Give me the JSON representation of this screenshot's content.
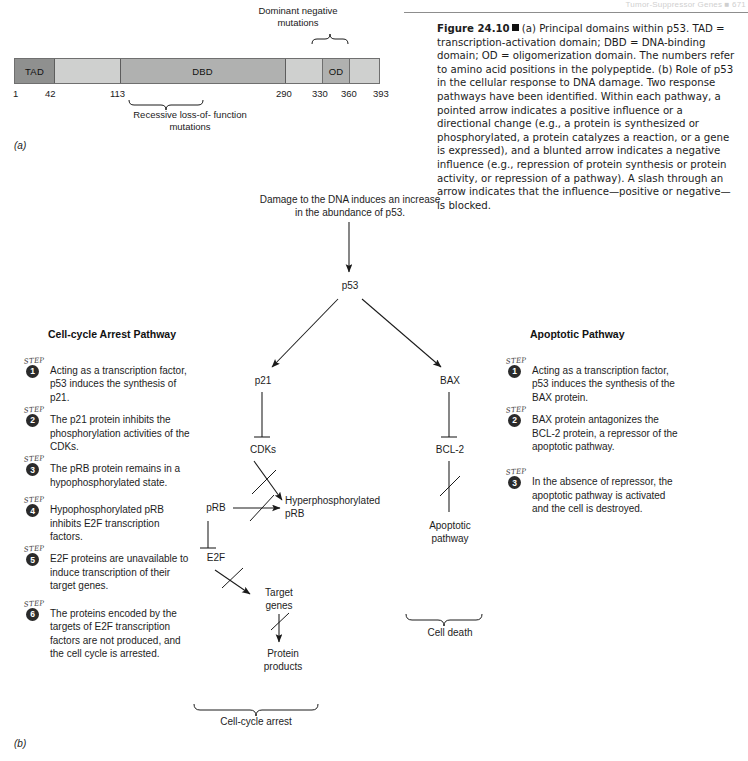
{
  "running_head": "Tumor-Suppressor Genes  ■  671",
  "panel_a": {
    "letter": "(a)",
    "bar_segments": [
      {
        "id": "TAD",
        "label": "TAD"
      },
      {
        "id": "spacer1",
        "label": ""
      },
      {
        "id": "DBD",
        "label": "DBD"
      },
      {
        "id": "spacer2",
        "label": ""
      },
      {
        "id": "OD",
        "label": "OD"
      },
      {
        "id": "spacer3",
        "label": ""
      }
    ],
    "axis_numbers": [
      "1",
      "42",
      "113",
      "290",
      "330",
      "360",
      "393"
    ],
    "dominant_label": "Dominant negative\nmutations",
    "recessive_label": "Recessive loss-of-\nfunction mutations"
  },
  "panel_b": {
    "letter": "(b)"
  },
  "caption": {
    "figure_label": "Figure 24.10",
    "text_a": "(a) Principal domains within p53. TAD = transcription-activation domain; DBD = DNA-binding domain; OD = oligomerization domain. The numbers refer to amino acid positions in the polypeptide.",
    "text_b": "(b) Role of p53 in the cellular response to DNA damage. Two response pathways have been identified. Within each pathway, a pointed arrow indicates a positive influence or a directional change (e.g., a protein is synthesized or phosphorylated, a protein catalyzes a reaction, or a gene is expressed), and a blunted arrow indicates a negative influence (e.g., repression of protein synthesis or protein activity, or repression of a pathway). A slash through an arrow indicates that the influence—positive or negative—is blocked."
  },
  "diagram": {
    "damage_text": "Damage to the DNA induces an increase in the abundance of p53.",
    "nodes": {
      "p53": "p53",
      "p21": "p21",
      "cdks": "CDKs",
      "prb": "pRB",
      "hyperphos": "Hyperphosphorylated\npRB",
      "e2f": "E2F",
      "target_genes": "Target\ngenes",
      "protein_products": "Protein\nproducts",
      "bax": "BAX",
      "bcl2": "BCL-2",
      "apoptotic_pathway": "Apoptotic\npathway"
    },
    "bracket_left": "Cell-cycle arrest",
    "bracket_right": "Cell death"
  },
  "left_pathway": {
    "title": "Cell-cycle Arrest Pathway",
    "step_word": "STEP",
    "steps": [
      {
        "n": "1",
        "text": "Acting as a transcription factor, p53 induces the synthesis of p21."
      },
      {
        "n": "2",
        "text": "The p21 protein inhibits the phosphorylation activities of the CDKs."
      },
      {
        "n": "3",
        "text": "The pRB protein remains in a hypophosphorylated state."
      },
      {
        "n": "4",
        "text": "Hypophosphorylated pRB inhibits E2F transcription factors."
      },
      {
        "n": "5",
        "text": "E2F proteins are unavailable to induce transcription of their target genes."
      },
      {
        "n": "6",
        "text": "The proteins encoded by the targets of E2F transcription factors are not produced, and the cell cycle is arrested."
      }
    ]
  },
  "right_pathway": {
    "title": "Apoptotic Pathway",
    "step_word": "STEP",
    "steps": [
      {
        "n": "1",
        "text": "Acting as a transcription factor, p53 induces the synthesis of the BAX protein."
      },
      {
        "n": "2",
        "text": "BAX protein antagonizes the BCL-2 protein, a repressor of the apoptotic pathway."
      },
      {
        "n": "3",
        "text": "In the absence of repressor, the apoptotic pathway is activated and the cell is destroyed."
      }
    ]
  },
  "colors": {
    "ink": "#1a1a1a",
    "bar_dark": "#8f908f",
    "bar_mid": "#b0b1b0",
    "bar_light": "#cfd0cf",
    "rule": "#8d8d8d"
  }
}
